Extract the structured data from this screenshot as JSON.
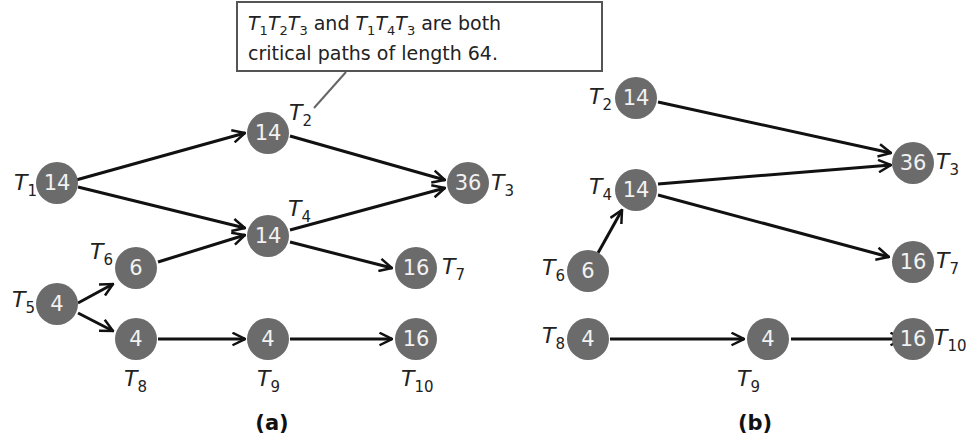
{
  "callout": {
    "line1_parts": [
      "T",
      "1",
      "T",
      "2",
      "T",
      "3",
      " and ",
      "T",
      "1",
      "T",
      "4",
      "T",
      "3",
      " are both"
    ],
    "line1": "T1T2T3 and T1T4T3 are both",
    "line2": "critical paths of length 64."
  },
  "diagram_a": {
    "caption": "(a)",
    "nodes": [
      {
        "id": "T1",
        "label": "T",
        "sub": "1",
        "value": "14"
      },
      {
        "id": "T2",
        "label": "T",
        "sub": "2",
        "value": "14"
      },
      {
        "id": "T3",
        "label": "T",
        "sub": "3",
        "value": "36"
      },
      {
        "id": "T4",
        "label": "T",
        "sub": "4",
        "value": "14"
      },
      {
        "id": "T5",
        "label": "T",
        "sub": "5",
        "value": "4"
      },
      {
        "id": "T6",
        "label": "T",
        "sub": "6",
        "value": "6"
      },
      {
        "id": "T7",
        "label": "T",
        "sub": "7",
        "value": "16"
      },
      {
        "id": "T8",
        "label": "T",
        "sub": "8",
        "value": "4"
      },
      {
        "id": "T9",
        "label": "T",
        "sub": "9",
        "value": "4"
      },
      {
        "id": "T10",
        "label": "T",
        "sub": "10",
        "value": "16"
      }
    ],
    "edges": [
      [
        "T1",
        "T2"
      ],
      [
        "T1",
        "T4"
      ],
      [
        "T2",
        "T3"
      ],
      [
        "T4",
        "T3"
      ],
      [
        "T4",
        "T7"
      ],
      [
        "T6",
        "T4"
      ],
      [
        "T5",
        "T6"
      ],
      [
        "T5",
        "T8"
      ],
      [
        "T8",
        "T9"
      ],
      [
        "T9",
        "T10"
      ]
    ]
  },
  "diagram_b": {
    "caption": "(b)",
    "nodes": [
      {
        "id": "T2",
        "label": "T",
        "sub": "2",
        "value": "14"
      },
      {
        "id": "T3",
        "label": "T",
        "sub": "3",
        "value": "36"
      },
      {
        "id": "T4",
        "label": "T",
        "sub": "4",
        "value": "14"
      },
      {
        "id": "T6",
        "label": "T",
        "sub": "6",
        "value": "6"
      },
      {
        "id": "T7",
        "label": "T",
        "sub": "7",
        "value": "16"
      },
      {
        "id": "T8",
        "label": "T",
        "sub": "8",
        "value": "4"
      },
      {
        "id": "T9",
        "label": "T",
        "sub": "9",
        "value": "4"
      },
      {
        "id": "T10",
        "label": "T",
        "sub": "10",
        "value": "16"
      }
    ],
    "edges": [
      [
        "T2",
        "T3"
      ],
      [
        "T4",
        "T3"
      ],
      [
        "T4",
        "T7"
      ],
      [
        "T6",
        "T4"
      ],
      [
        "T8",
        "T9"
      ],
      [
        "T9",
        "T10"
      ]
    ]
  }
}
